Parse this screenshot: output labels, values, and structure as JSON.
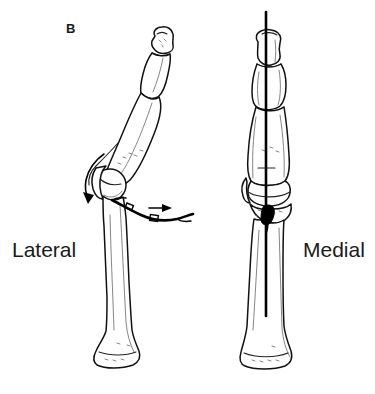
{
  "figure": {
    "panel_label": "B",
    "background_color": "#ffffff",
    "ink_color": "#111111",
    "width": 375,
    "height": 394,
    "type": "anatomical-line-drawing"
  },
  "labels": {
    "left_view": "Lateral",
    "right_view": "Medial"
  },
  "views": {
    "lateral": {
      "name": "Lateral",
      "posture": "flexed",
      "bones": [
        "distal phalanx",
        "middle phalanx",
        "proximal phalanx",
        "metacarpal"
      ],
      "implant": "curved wire / suture loop passing around palmar aspect",
      "annotations": [
        {
          "name": "curved-rotation-arrow",
          "direction": "down-left",
          "meaning": "rotation of proximal sesamoid / soft tissue"
        },
        {
          "name": "horizontal-traction-arrow",
          "direction": "right",
          "meaning": "direction of traction on wire"
        }
      ]
    },
    "medial": {
      "name": "Medial",
      "posture": "extended",
      "bones": [
        "distal phalanx",
        "middle phalanx",
        "proximal phalanx",
        "metacarpal"
      ],
      "implant": "straight intramedullary pin along long axis",
      "annotations": [
        {
          "name": "bone-anchor-marker",
          "meaning": "fixation anchor at distal metacarpal"
        }
      ]
    }
  }
}
